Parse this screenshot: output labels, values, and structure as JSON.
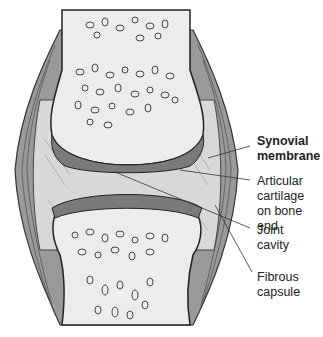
{
  "figure": {
    "colors": {
      "bone": "#e9e9e9",
      "bone_outline": "#333333",
      "cartilage": "#cfcfcf",
      "capsule": "#8a8a8a",
      "cavity": "#dcdcdc",
      "label_text": "#222222"
    }
  },
  "labels": [
    {
      "id": "synovial-membrane",
      "text": "Synovial\nmembrane",
      "bold": true,
      "top": 134
    },
    {
      "id": "articular-cartilage",
      "text": "Articular\ncartilage\non bone end",
      "bold": false,
      "top": 174
    },
    {
      "id": "joint-cavity",
      "text": "Joint\ncavity",
      "bold": false,
      "top": 223
    },
    {
      "id": "fibrous-capsule",
      "text": "Fibrous\ncapsule",
      "bold": false,
      "top": 270
    }
  ]
}
